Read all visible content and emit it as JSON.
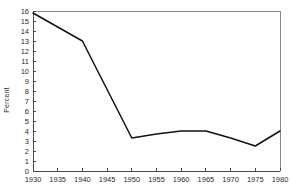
{
  "chart_data": {
    "type": "line",
    "title": "",
    "subtitle": "",
    "xlabel": "",
    "ylabel": "Percent",
    "xlim": [
      1930,
      1980
    ],
    "ylim": [
      0,
      16
    ],
    "grid": false,
    "legend": null,
    "xticks": [
      1930,
      1935,
      1940,
      1945,
      1950,
      1955,
      1960,
      1965,
      1970,
      1975,
      1980
    ],
    "yticks": [
      0,
      1,
      2,
      3,
      4,
      5,
      6,
      7,
      8,
      9,
      10,
      11,
      12,
      13,
      14,
      15,
      16
    ],
    "xtick_labels": [
      "1930",
      "1935",
      "1940",
      "1945",
      "1950",
      "1955",
      "1960",
      "1965",
      "1970",
      "1975",
      "1980"
    ],
    "ytick_labels": [
      "0",
      "1",
      "2",
      "3",
      "4",
      "5",
      "6",
      "7",
      "8",
      "9",
      "10",
      "11",
      "12",
      "13",
      "14",
      "15",
      "16"
    ],
    "series": [
      {
        "name": "Percent",
        "color": "#111111",
        "x": [
          1930,
          1940,
          1950,
          1955,
          1960,
          1965,
          1970,
          1975,
          1980
        ],
        "values": [
          15.8,
          13.0,
          3.3,
          3.7,
          4.0,
          4.0,
          3.3,
          2.5,
          4.0
        ]
      }
    ],
    "annotations": []
  },
  "figure": {
    "background_color": "#ffffff",
    "line_color": "#111111",
    "axis_color": "#4a4a4a",
    "frame_color": "#8a8a8a"
  }
}
